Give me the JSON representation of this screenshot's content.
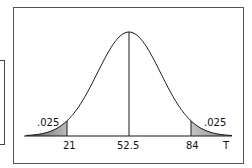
{
  "chart_data": {
    "type": "area",
    "title": "",
    "subtitle": "",
    "xlabel": "T",
    "ylabel": "",
    "distribution": "normal",
    "mean": 52.5,
    "tick_labels": [
      "21",
      "52.5",
      "84"
    ],
    "tick_values": [
      21,
      52.5,
      84
    ],
    "shaded_regions": [
      {
        "name": "left-tail",
        "from": null,
        "to": 21,
        "probability": ".025"
      },
      {
        "name": "right-tail",
        "from": 84,
        "to": null,
        "probability": ".025"
      }
    ],
    "annotations": [
      {
        "text": ".025",
        "position": "left-tail"
      },
      {
        "text": ".025",
        "position": "right-tail"
      }
    ],
    "grid": false,
    "legend": null
  },
  "labels": {
    "left_prob": ".025",
    "right_prob": ".025",
    "tick_left": "21",
    "tick_center": "52.5",
    "tick_right": "84",
    "axis_label": "T"
  },
  "colors": {
    "curve": "#1a1a1a",
    "shade": "#9a9a9a",
    "frame": "#555555"
  }
}
